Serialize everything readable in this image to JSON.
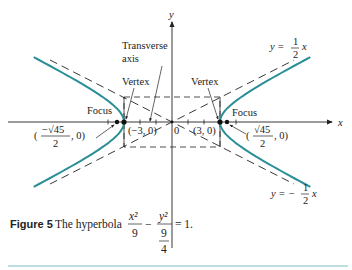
{
  "figure": {
    "axes": {
      "x_label": "x",
      "y_label": "y",
      "origin_label": "0"
    },
    "colors": {
      "curve": "#2a8f97",
      "ink": "#222222",
      "rule": "#7fbfc4"
    },
    "hyperbola": {
      "a": 3,
      "b": 1.5,
      "equation": "x^2/9 - y^2/(9/4) = 1"
    },
    "labels": {
      "transverse_axis_line1": "Transverse",
      "transverse_axis_line2": "axis",
      "vertex_left": "Vertex",
      "vertex_right": "Vertex",
      "focus_left": "Focus",
      "focus_right": "Focus",
      "vertex_left_coord": "(−3, 0)",
      "vertex_right_coord": "(3, 0)",
      "focus_left_num": "−√45",
      "focus_left_den": "2",
      "focus_left_tail": ", 0)",
      "focus_right_num": "√45",
      "focus_right_den": "2",
      "focus_right_tail": ", 0)",
      "asymptote_pos_lhs": "y =",
      "asymptote_pos_num": "1",
      "asymptote_pos_den": "2",
      "asymptote_pos_var": "x",
      "asymptote_neg_lhs": "y = −",
      "asymptote_neg_num": "1",
      "asymptote_neg_den": "2",
      "asymptote_neg_var": "x"
    },
    "caption": {
      "figure_label": "Figure 5",
      "text": "The hyperbola",
      "num1": "x²",
      "den1": "9",
      "minus": "−",
      "num2": "y²",
      "den2_num": "9",
      "den2_den": "4",
      "rhs": "= 1."
    }
  }
}
